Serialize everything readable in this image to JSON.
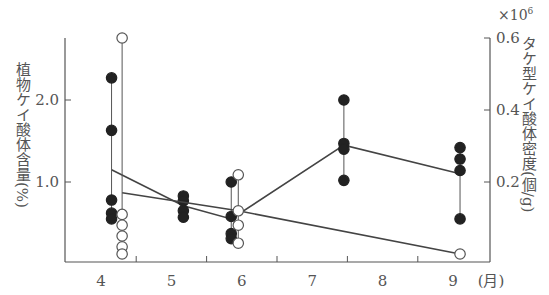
{
  "chart_data": {
    "type": "scatter",
    "title": "",
    "xlabel": "(月)",
    "ylabel_left": "植物ケイ酸体含量(%)",
    "ylabel_right": "タケ型ケイ酸体密度(個/g)",
    "right_axis_multiplier": "×10",
    "right_axis_exponent": "6",
    "x_ticks": [
      "4",
      "5",
      "6",
      "7",
      "8",
      "9"
    ],
    "x_unit": "(月)",
    "y_left_ticks": [
      "1.0",
      "2.0"
    ],
    "y_right_ticks": [
      "0.2",
      "0.4",
      "0.6"
    ],
    "xlim": [
      3.5,
      9.5
    ],
    "ylim_left": [
      0,
      2.75
    ],
    "ylim_right": [
      0,
      0.62
    ],
    "grid": false,
    "series": [
      {
        "name": "植物ケイ酸体含量 (filled circles, left axis)",
        "marker": "filled-circle",
        "axis": "left",
        "groups": [
          {
            "x": 4.15,
            "values": [
              2.27,
              1.63,
              0.78,
              0.62,
              0.55
            ],
            "mean": 1.15
          },
          {
            "x": 5.17,
            "values": [
              0.83,
              0.77,
              0.65,
              0.57
            ],
            "mean": 0.71
          },
          {
            "x": 5.85,
            "values": [
              1.0,
              0.58,
              0.37,
              0.31
            ],
            "mean": 0.55
          },
          {
            "x": 7.45,
            "values": [
              2.0,
              1.47,
              1.4,
              1.02
            ],
            "mean": 1.45
          },
          {
            "x": 9.1,
            "values": [
              1.42,
              1.28,
              1.14,
              0.55
            ],
            "mean": 1.1
          }
        ]
      },
      {
        "name": "タケ型ケイ酸体密度 (open circles, right axis)",
        "marker": "open-circle",
        "axis": "right",
        "groups": [
          {
            "x": 4.3,
            "values": [
              0.6,
              0.11,
              0.08,
              0.05,
              0.02,
              0.0
            ],
            "mean": 0.17
          },
          {
            "x": 5.95,
            "values": [
              0.22,
              0.12,
              0.08,
              0.03
            ],
            "mean": 0.12
          },
          {
            "x": 9.1,
            "values": [
              0.0
            ],
            "mean": 0.0
          }
        ]
      }
    ]
  }
}
